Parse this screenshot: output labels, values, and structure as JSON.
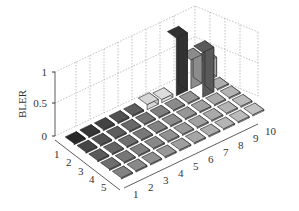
{
  "chart_data": {
    "type": "bar3d",
    "title": "",
    "zlabel": "BLER",
    "zlim": [
      0,
      1
    ],
    "z_ticks": [
      "0",
      "0.5",
      "1"
    ],
    "y_ticks": [
      "1",
      "2",
      "3",
      "4",
      "5"
    ],
    "x_ticks": [
      "1",
      "2",
      "3",
      "4",
      "5",
      "6",
      "7",
      "8",
      "9",
      "10"
    ],
    "grid": true,
    "rows": [
      {
        "row": 1,
        "values": [
          0.0,
          0.0,
          0.0,
          0.0,
          0.0,
          0.08,
          0.05,
          0.9,
          0.45,
          0.3
        ]
      },
      {
        "row": 2,
        "values": [
          0.0,
          0.0,
          0.0,
          0.0,
          0.0,
          0.0,
          0.0,
          0.0,
          0.7,
          0.0
        ]
      },
      {
        "row": 3,
        "values": [
          0.0,
          0.0,
          0.0,
          0.0,
          0.0,
          0.0,
          0.0,
          0.0,
          0.0,
          0.0
        ]
      },
      {
        "row": 4,
        "values": [
          0.0,
          0.0,
          0.0,
          0.0,
          0.0,
          0.0,
          0.0,
          0.0,
          0.0,
          0.0
        ]
      },
      {
        "row": 5,
        "values": [
          0.0,
          0.0,
          0.0,
          0.0,
          0.0,
          0.0,
          0.0,
          0.0,
          0.0,
          0.0
        ]
      }
    ],
    "note": "Bars: row1 x8≈0.9, row1 x9≈0.45(dark), row2 x9≈0.75, row1 x10≈0.5?, row2 x10≈0.55 (black) — approximate."
  }
}
